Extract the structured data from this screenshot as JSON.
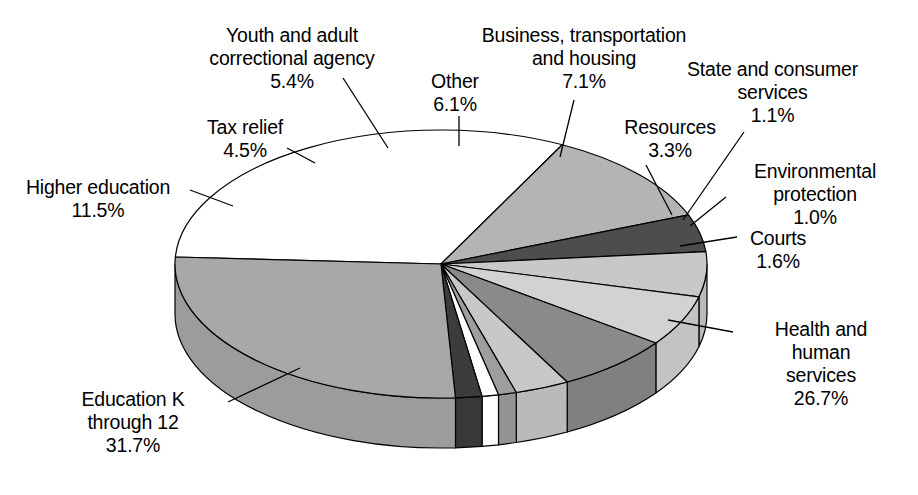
{
  "chart_data": {
    "type": "pie",
    "title": "",
    "subtitle": "",
    "xlabel": "",
    "ylabel": "",
    "legend_position": "callout-labels",
    "grid": false,
    "style": "3d-exploded-pie",
    "total_percent": 100.0,
    "categories": [
      "Education K through 12",
      "Higher education",
      "Tax relief",
      "Youth and adult correctional agency",
      "Other",
      "Business, transportation and housing",
      "Resources",
      "State and consumer services",
      "Environmental protection",
      "Courts",
      "Health and human services"
    ],
    "values": [
      31.7,
      11.5,
      4.5,
      5.4,
      6.1,
      7.1,
      3.3,
      1.1,
      1.0,
      1.6,
      26.7
    ],
    "slices": [
      {
        "name": "Education K through 12",
        "value": 31.7,
        "value_label": "31.7%",
        "fill": "#ffffff",
        "label_lines": [
          "Education K",
          "through 12",
          "31.7%"
        ],
        "label_align": "center",
        "label_left": 38,
        "label_top": 388,
        "label_width": 190,
        "leader": true
      },
      {
        "name": "Higher education",
        "value": 11.5,
        "value_label": "11.5%",
        "fill": "#b4b4b4",
        "label_lines": [
          "Higher education",
          "11.5%"
        ],
        "label_align": "center",
        "label_left": 8,
        "label_top": 176,
        "label_width": 180,
        "leader": true
      },
      {
        "name": "Tax relief",
        "value": 4.5,
        "value_label": "4.5%",
        "fill": "#4d4d4d",
        "label_lines": [
          "Tax relief",
          "4.5%"
        ],
        "label_align": "center",
        "label_left": 175,
        "label_top": 116,
        "label_width": 140,
        "leader": true
      },
      {
        "name": "Youth and adult correctional agency",
        "value": 5.4,
        "value_label": "5.4%",
        "fill": "#c8c8c8",
        "label_lines": [
          "Youth and adult",
          "correctional agency",
          "5.4%"
        ],
        "label_align": "center",
        "label_left": 182,
        "label_top": 24,
        "label_width": 220,
        "leader": true
      },
      {
        "name": "Other",
        "value": 6.1,
        "value_label": "6.1%",
        "fill": "#d2d2d2",
        "label_lines": [
          "Other",
          "6.1%"
        ],
        "label_align": "center",
        "label_left": 400,
        "label_top": 70,
        "label_width": 110,
        "leader": true
      },
      {
        "name": "Business, transportation and housing",
        "value": 7.1,
        "value_label": "7.1%",
        "fill": "#8a8a8a",
        "label_lines": [
          "Business, transportation",
          "and housing",
          "7.1%"
        ],
        "label_align": "center",
        "label_left": 448,
        "label_top": 24,
        "label_width": 272,
        "leader": true
      },
      {
        "name": "Resources",
        "value": 3.3,
        "value_label": "3.3%",
        "fill": "#c8c8c8",
        "label_lines": [
          "Resources",
          "3.3%"
        ],
        "label_align": "center",
        "label_left": 600,
        "label_top": 116,
        "label_width": 140,
        "leader": true
      },
      {
        "name": "State and consumer services",
        "value": 1.1,
        "value_label": "1.1%",
        "fill": "#9e9e9e",
        "label_lines": [
          "State and consumer",
          "services",
          "1.1%"
        ],
        "label_align": "center",
        "label_left": 660,
        "label_top": 58,
        "label_width": 225,
        "leader": true
      },
      {
        "name": "Environmental protection",
        "value": 1.0,
        "value_label": "1.0%",
        "fill": "#ffffff",
        "label_lines": [
          "Environmental",
          "protection",
          "1.0%"
        ],
        "label_align": "center",
        "label_left": 720,
        "label_top": 160,
        "label_width": 190,
        "leader": true
      },
      {
        "name": "Courts",
        "value": 1.6,
        "value_label": "1.6%",
        "fill": "#3c3c3c",
        "label_lines": [
          "Courts",
          "1.6%"
        ],
        "label_align": "center",
        "label_left": 718,
        "label_top": 227,
        "label_width": 120,
        "leader": true
      },
      {
        "name": "Health and human services",
        "value": 26.7,
        "value_label": "26.7%",
        "fill": "#a8a8a8",
        "label_lines": [
          "Health and",
          "human",
          "services",
          "26.7%"
        ],
        "label_align": "center",
        "label_left": 736,
        "label_top": 318,
        "label_width": 170,
        "leader": true
      }
    ],
    "geometry": {
      "cx": 441,
      "cy": 264,
      "rx": 266,
      "ry": 134,
      "depth": 50,
      "start_angle_deg": 183,
      "direction": "clockwise",
      "stroke": "#000000",
      "stroke_width": 1.2
    },
    "leaders": [
      {
        "name": "Education K through 12",
        "x1": 228,
        "y1": 402,
        "x2": 300,
        "y2": 368
      },
      {
        "name": "Higher education",
        "x1": 190,
        "y1": 190,
        "x2": 233,
        "y2": 206
      },
      {
        "name": "Tax relief",
        "x1": 287,
        "y1": 148,
        "x2": 315,
        "y2": 163
      },
      {
        "name": "Youth and adult correctional agency",
        "x1": 343,
        "y1": 78,
        "x2": 388,
        "y2": 148
      },
      {
        "name": "Other",
        "x1": 459,
        "y1": 116,
        "x2": 459,
        "y2": 146
      },
      {
        "name": "Business, transportation and housing",
        "x1": 574,
        "y1": 100,
        "x2": 560,
        "y2": 157
      },
      {
        "name": "Resources",
        "x1": 646,
        "y1": 165,
        "x2": 672,
        "y2": 215
      },
      {
        "name": "State and consumer services",
        "x1": 744,
        "y1": 132,
        "x2": 683,
        "y2": 220
      },
      {
        "name": "Environmental protection",
        "x1": 726,
        "y1": 197,
        "x2": 690,
        "y2": 226
      },
      {
        "name": "Courts",
        "x1": 737,
        "y1": 237,
        "x2": 680,
        "y2": 246
      },
      {
        "name": "Health and human services",
        "x1": 733,
        "y1": 332,
        "x2": 668,
        "y2": 320
      }
    ]
  }
}
